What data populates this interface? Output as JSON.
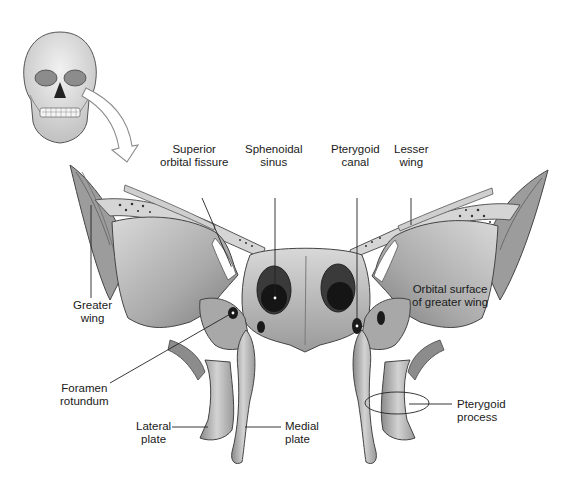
{
  "diagram": {
    "inset": "skull-with-arrow",
    "labels": [
      {
        "id": "superior-orbital-fissure",
        "lines": [
          "Superior",
          "orbital fissure"
        ]
      },
      {
        "id": "sphenoidal-sinus",
        "lines": [
          "Sphenoidal",
          "sinus"
        ]
      },
      {
        "id": "pterygoid-canal",
        "lines": [
          "Pterygoid",
          "canal"
        ]
      },
      {
        "id": "lesser-wing",
        "lines": [
          "Lesser",
          "wing"
        ]
      },
      {
        "id": "greater-wing",
        "lines": [
          "Greater",
          "wing"
        ]
      },
      {
        "id": "orbital-surface-greater-wing",
        "lines": [
          "Orbital surface",
          "of greater wing"
        ]
      },
      {
        "id": "foramen-rotundum",
        "lines": [
          "Foramen",
          "rotundum"
        ]
      },
      {
        "id": "lateral-plate",
        "lines": [
          "Lateral",
          "plate"
        ]
      },
      {
        "id": "medial-plate",
        "lines": [
          "Medial",
          "plate"
        ]
      },
      {
        "id": "pterygoid-process",
        "lines": [
          "Pterygoid",
          "process"
        ]
      }
    ]
  },
  "colors": {
    "bone_light": "#e6e6e6",
    "bone_mid": "#b9b9b9",
    "bone_dark": "#7a7a7a",
    "cavity": "#1e1e1e",
    "line": "#222222"
  }
}
